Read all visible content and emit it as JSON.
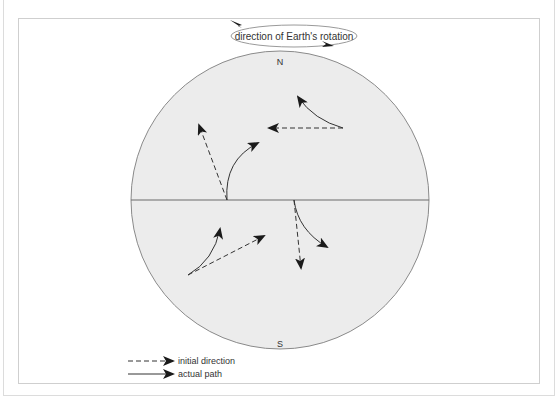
{
  "rotation": {
    "label": "direction of Earth's rotation"
  },
  "globe": {
    "north_label": "N",
    "south_label": "S",
    "fill_color": "#ececec",
    "outline_color": "#8a8a8a"
  },
  "legend": {
    "items": [
      {
        "style": "dashed",
        "label": "initial direction"
      },
      {
        "style": "solid",
        "label": "actual path"
      }
    ]
  },
  "arrows": [
    {
      "hemisphere": "north",
      "position": "upper-right",
      "initial_direction": "west",
      "actual_path": "curves north (right-deflected)"
    },
    {
      "hemisphere": "north",
      "position": "equator-left",
      "initial_direction": "north-northwest",
      "actual_path": "curves northeast (right-deflected)"
    },
    {
      "hemisphere": "south",
      "position": "lower-left",
      "initial_direction": "east-northeast",
      "actual_path": "curves north (left-deflected)"
    },
    {
      "hemisphere": "south",
      "position": "equator-right",
      "initial_direction": "south",
      "actual_path": "curves southeast (left-deflected)"
    }
  ]
}
